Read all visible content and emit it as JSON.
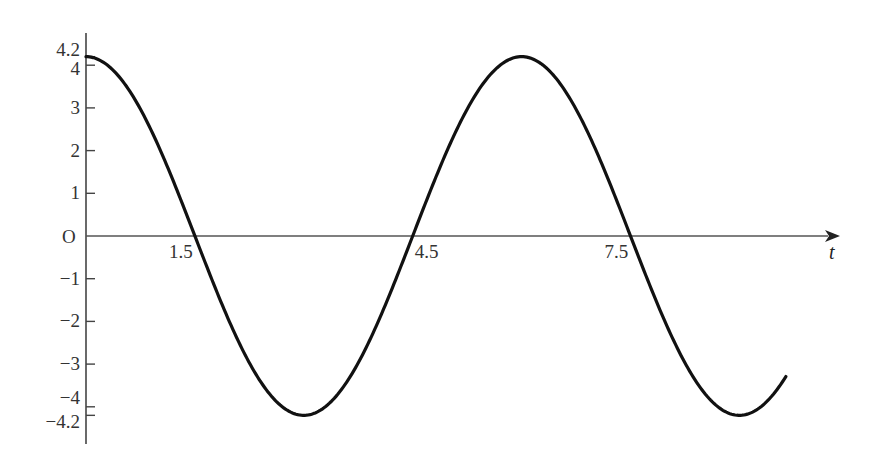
{
  "chart_data": {
    "type": "line",
    "title": "",
    "function": "y = 4.2 cos(pi t / 3)",
    "xlabel": "t",
    "ylabel": "",
    "origin_label": "O",
    "xlim": [
      0,
      9.64
    ],
    "ylim": [
      -4.2,
      4.2
    ],
    "grid": false,
    "legend": null,
    "x_ticks": [
      {
        "value": 1.5,
        "label": "1.5"
      },
      {
        "value": 4.5,
        "label": "4.5"
      },
      {
        "value": 7.5,
        "label": "7.5"
      }
    ],
    "y_ticks": [
      {
        "value": 4.2,
        "label": "4.2"
      },
      {
        "value": 4,
        "label": "4"
      },
      {
        "value": 3,
        "label": "3"
      },
      {
        "value": 2,
        "label": "2"
      },
      {
        "value": 1,
        "label": "1"
      },
      {
        "value": -1,
        "label": "−1"
      },
      {
        "value": -2,
        "label": "−2"
      },
      {
        "value": -3,
        "label": "−3"
      },
      {
        "value": -4,
        "label": "−4"
      },
      {
        "value": -4.2,
        "label": "−4.2"
      }
    ],
    "series": [
      {
        "name": "displacement",
        "amplitude": 4.2,
        "period": 6,
        "x": [
          0,
          0.5,
          1,
          1.5,
          2,
          2.5,
          3,
          3.5,
          4,
          4.5,
          5,
          5.5,
          6,
          6.5,
          7,
          7.5,
          8,
          8.5,
          9,
          9.5,
          9.64
        ],
        "values": [
          4.2,
          3.64,
          2.1,
          0,
          -2.1,
          -3.64,
          -4.2,
          -3.64,
          -2.1,
          0,
          2.1,
          3.64,
          4.2,
          3.64,
          2.1,
          0,
          -2.1,
          -3.64,
          -4.2,
          -3.64,
          -3.15
        ]
      }
    ],
    "key_points": {
      "zeros": [
        1.5,
        4.5,
        7.5
      ],
      "maxima": [
        {
          "t": 0,
          "y": 4.2
        },
        {
          "t": 6,
          "y": 4.2
        }
      ],
      "minima": [
        {
          "t": 3,
          "y": -4.2
        },
        {
          "t": 9,
          "y": -4.2
        }
      ]
    },
    "colors": {
      "curve": "#111111",
      "axis": "#444444"
    }
  }
}
